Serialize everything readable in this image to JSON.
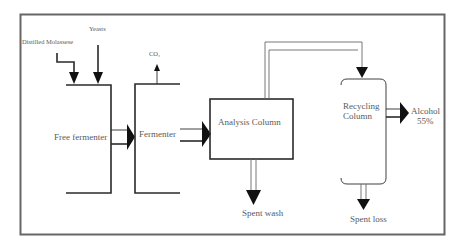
{
  "diagram": {
    "title": "",
    "type": "process-flow",
    "colors": {
      "frame": "#666666",
      "line": "#2a2a2a",
      "text": "#5a5a5a",
      "arrow": "#111111"
    },
    "inputs": {
      "distilled_molasses": "Distilled Molassese",
      "yeasts": "Yeasts"
    },
    "gas_output": {
      "co2": "CO₂"
    },
    "nodes": [
      {
        "id": "free-fermenter",
        "label": "Free fermenter"
      },
      {
        "id": "fermenter",
        "label": "Fermenter"
      },
      {
        "id": "analysis-column",
        "label": "Analysis Column"
      },
      {
        "id": "recycling-column",
        "label_line1": "Recycling",
        "label_line2": "Column"
      }
    ],
    "outputs": {
      "alcohol_line1": "Alcohol",
      "alcohol_line2": "55%",
      "spent_wash": "Spent wash",
      "spent_loss": "Spent loss"
    },
    "edges": [
      {
        "from": "Distilled Molassese",
        "to": "Free fermenter"
      },
      {
        "from": "Yeasts",
        "to": "Free fermenter"
      },
      {
        "from": "Free fermenter",
        "to": "Fermenter"
      },
      {
        "from": "Fermenter",
        "to": "CO₂"
      },
      {
        "from": "Fermenter",
        "to": "Analysis Column"
      },
      {
        "from": "Analysis Column",
        "to": "Recycling Column"
      },
      {
        "from": "Analysis Column",
        "to": "Spent wash"
      },
      {
        "from": "Recycling Column",
        "to": "Alcohol 55%"
      },
      {
        "from": "Recycling Column",
        "to": "Spent loss"
      }
    ]
  }
}
